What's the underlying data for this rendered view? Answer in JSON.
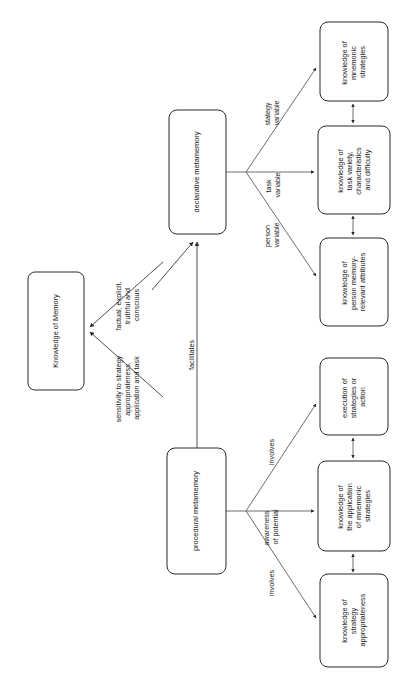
{
  "diagram": {
    "orientation": "rotated-90-counterclockwise",
    "background_color": "#ffffff",
    "line_color": "#3a3a3a",
    "text_color": "#1a1a1a",
    "nodes": [
      {
        "id": "knowledge-of-memory",
        "lines": [
          "Knowledge of Memory"
        ]
      },
      {
        "id": "declarative-metamemory",
        "lines": [
          "declarative metamemory"
        ]
      },
      {
        "id": "procedural-metamemory",
        "lines": [
          "procedural metamemory"
        ]
      },
      {
        "id": "knowledge-of-mnemonic-strategies",
        "lines": [
          "knowledge of",
          "mnemonic",
          "strategies"
        ]
      },
      {
        "id": "knowledge-of-task-variety",
        "lines": [
          "knowledge of",
          "task variety,",
          "characteristics",
          "and difficulty"
        ]
      },
      {
        "id": "knowledge-of-person-memory",
        "lines": [
          "knowledge of",
          "person memory-",
          "relevant attributes"
        ]
      },
      {
        "id": "execution-of-strategies",
        "lines": [
          "execution of",
          "strategies or",
          "action"
        ]
      },
      {
        "id": "knowledge-of-application",
        "lines": [
          "knowledge of",
          "the application",
          "of mnemonic",
          "strategies"
        ]
      },
      {
        "id": "knowledge-of-strategy-appropriateness",
        "lines": [
          "knowledge of",
          "strategy",
          "appropriateness"
        ]
      }
    ],
    "edge_labels": [
      {
        "id": "factual-explicit",
        "lines": [
          "factual, explicit,",
          "truthful and",
          "conscious"
        ]
      },
      {
        "id": "sensitivity-to-strategy",
        "lines": [
          "sensitivity to strategy",
          "appropriateness,",
          "application and task"
        ]
      },
      {
        "id": "facilitates",
        "lines": [
          "facilitates"
        ]
      },
      {
        "id": "stategy-variable",
        "lines": [
          "stategy",
          "variable"
        ]
      },
      {
        "id": "task-variable",
        "lines": [
          "task",
          "variable"
        ]
      },
      {
        "id": "person-variable",
        "lines": [
          "person",
          "variable"
        ]
      },
      {
        "id": "involves-top",
        "lines": [
          "involves"
        ]
      },
      {
        "id": "awareness-of-potential",
        "lines": [
          "awareness",
          "of potential"
        ]
      },
      {
        "id": "involves-bottom",
        "lines": [
          "involves"
        ]
      }
    ]
  }
}
